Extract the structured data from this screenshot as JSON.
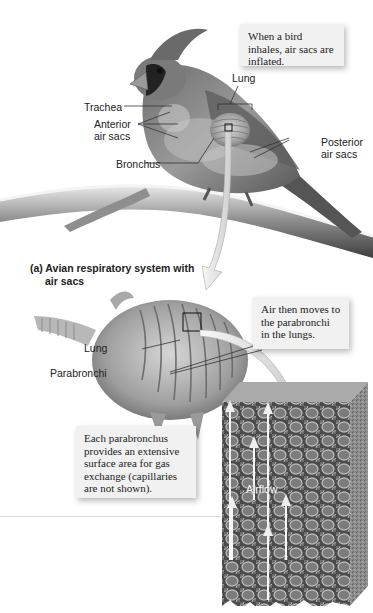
{
  "figure": {
    "callouts": {
      "inhale": "When a bird inhales, air sacs are inflated.",
      "parabronchi_move": "Air then moves to the parabronchi in the lungs.",
      "gas_exchange": "Each parabronchus provides an extensive surface area for gas exchange (capillaries are not shown)."
    },
    "labels": {
      "lung_top": "Lung",
      "trachea": "Trachea",
      "anterior_air_sacs_line1": "Anterior",
      "anterior_air_sacs_line2": "air sacs",
      "posterior_air_sacs_line1": "Posterior",
      "posterior_air_sacs_line2": "air sacs",
      "bronchus": "Bronchus",
      "lung_middle": "Lung",
      "parabronchi": "Parabronchi",
      "airflow": "Airflow"
    },
    "caption": {
      "line1": "(a) Avian respiratory system with",
      "line2": "air sacs"
    }
  }
}
